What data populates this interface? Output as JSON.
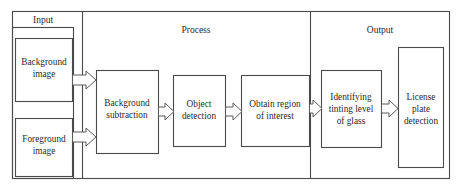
{
  "diagram": {
    "type": "flowchart",
    "orientation": "left-to-right",
    "background_color": "#ffffff",
    "line_color": "#4a4a4a",
    "text_color": "#2b2b2b",
    "sections": [
      {
        "id": "input",
        "label": "Input"
      },
      {
        "id": "process",
        "label": "Process"
      },
      {
        "id": "output",
        "label": "Output"
      }
    ],
    "nodes": [
      {
        "id": "background-image",
        "section": "input",
        "lines": [
          "Background",
          "image"
        ]
      },
      {
        "id": "foreground-image",
        "section": "input",
        "lines": [
          "Foreground",
          "image"
        ]
      },
      {
        "id": "background-subtraction",
        "section": "process",
        "lines": [
          "Background",
          "subtraction"
        ]
      },
      {
        "id": "object-detection",
        "section": "process",
        "lines": [
          "Object",
          "detection"
        ]
      },
      {
        "id": "obtain-region",
        "section": "process",
        "lines": [
          "Obtain region",
          "of interest"
        ]
      },
      {
        "id": "identify-tinting",
        "section": "output",
        "lines": [
          "Identifying",
          "tinting level",
          "of glass"
        ]
      },
      {
        "id": "license-plate",
        "section": "output",
        "lines": [
          "License",
          "plate",
          "detection"
        ]
      }
    ],
    "edges": [
      {
        "from": "background-image",
        "to": "background-subtraction",
        "style": "block-arrow"
      },
      {
        "from": "foreground-image",
        "to": "background-subtraction",
        "style": "block-arrow"
      },
      {
        "from": "background-subtraction",
        "to": "object-detection",
        "style": "block-arrow"
      },
      {
        "from": "object-detection",
        "to": "obtain-region",
        "style": "block-arrow"
      },
      {
        "from": "obtain-region",
        "to": "identify-tinting",
        "style": "block-arrow"
      },
      {
        "from": "identify-tinting",
        "to": "license-plate",
        "style": "block-arrow"
      }
    ]
  }
}
